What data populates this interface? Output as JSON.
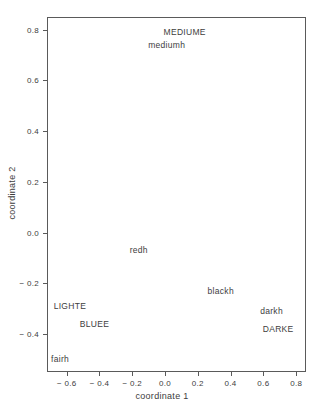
{
  "chart_data": {
    "type": "scatter",
    "title": "",
    "xlabel": "coordinate 1",
    "ylabel": "coordinate 2",
    "xlim": [
      -0.72,
      0.86
    ],
    "ylim": [
      -0.55,
      0.85
    ],
    "xticks": [
      "-0.6",
      "-0.4",
      "-0.2",
      "0.0",
      "0.2",
      "0.4",
      "0.6",
      "0.8"
    ],
    "xtick_values": [
      -0.6,
      -0.4,
      -0.2,
      0.0,
      0.2,
      0.4,
      0.6,
      0.8
    ],
    "yticks": [
      "0.8",
      "0.6",
      "0.4",
      "0.2",
      "0.0",
      "-0.2",
      "-0.4"
    ],
    "ytick_values": [
      0.8,
      0.6,
      0.4,
      0.2,
      0.0,
      -0.2,
      -0.4
    ],
    "grid": false,
    "legend": "none",
    "marker": "text-label",
    "points": [
      {
        "label": "MEDIUME",
        "x": 0.12,
        "y": 0.79
      },
      {
        "label": "mediumh",
        "x": 0.01,
        "y": 0.74
      },
      {
        "label": "redh",
        "x": -0.16,
        "y": -0.07
      },
      {
        "label": "blackh",
        "x": 0.34,
        "y": -0.23
      },
      {
        "label": "LIGHTE",
        "x": -0.58,
        "y": -0.29
      },
      {
        "label": "darkh",
        "x": 0.65,
        "y": -0.31
      },
      {
        "label": "BLUEE",
        "x": -0.43,
        "y": -0.36
      },
      {
        "label": "DARKE",
        "x": 0.69,
        "y": -0.38
      },
      {
        "label": "fairh",
        "x": -0.64,
        "y": -0.5
      }
    ]
  },
  "style": {
    "frame_color": "#5a5a5a",
    "text_color": "#3d3d3d",
    "background": "#ffffff"
  }
}
